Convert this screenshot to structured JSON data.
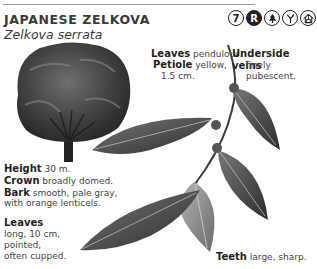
{
  "header": {
    "common_name": "JAPANESE ZELKOVA",
    "scientific_name": "Zelkova serrata",
    "icons": [
      {
        "name": "zone-7-icon",
        "label": "7"
      },
      {
        "name": "r-badge-icon",
        "label": "R"
      },
      {
        "name": "conifer-tree-icon",
        "label": ""
      },
      {
        "name": "branching-icon",
        "label": ""
      },
      {
        "name": "house-icon",
        "label": ""
      }
    ]
  },
  "annotations": {
    "leaves_pendulous": {
      "term": "Leaves",
      "text": " pendulous."
    },
    "petiole": {
      "term": "Petiole",
      "text": " yellow,",
      "line2": "1.5 cm."
    },
    "underside": {
      "term": "Underside veins",
      "text": "finely pubescent."
    },
    "height": {
      "term": "Height",
      "text": " 30 m."
    },
    "crown": {
      "term": "Crown",
      "text": " broadly domed."
    },
    "bark": {
      "term": "Bark",
      "text": " smooth, pale gray,",
      "line2": "with orange lenticels."
    },
    "leaves_shape": {
      "term": "Leaves",
      "lines": [
        "long, 10 cm,",
        "pointed,",
        "often cupped."
      ]
    },
    "teeth": {
      "term": "Teeth",
      "text": " large, sharp."
    }
  }
}
